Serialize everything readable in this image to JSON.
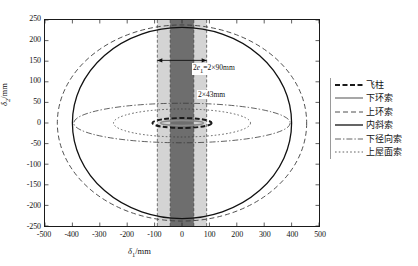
{
  "chart_data": {
    "type": "line",
    "title": "",
    "xlabel": "δ1/mm",
    "ylabel": "δ2/mm",
    "xlim": [
      -500,
      500
    ],
    "ylim": [
      -250,
      250
    ],
    "grid": false,
    "legend_position": "right",
    "xticks": [
      -500,
      -400,
      -300,
      -200,
      -100,
      0,
      100,
      200,
      300,
      400,
      500
    ],
    "yticks": [
      250,
      200,
      150,
      100,
      50,
      0,
      -50,
      -100,
      -150,
      -200,
      -250
    ],
    "series": [
      {
        "name": "飞柱",
        "style": "dashed-thick",
        "color": "#1a1a1a",
        "shape": "ellipse",
        "center": [
          0,
          0
        ],
        "semi_x": 108,
        "semi_y": 12
      },
      {
        "name": "下环索",
        "style": "solid-gray",
        "color": "#8a8a8a",
        "shape": "ellipse",
        "center": [
          0,
          0
        ],
        "semi_x": 78,
        "semi_y": 6
      },
      {
        "name": "上环索",
        "style": "dashed",
        "color": "#3a3a3a",
        "shape": "ellipse",
        "center": [
          0,
          0
        ],
        "semi_x": 455,
        "semi_y": 238
      },
      {
        "name": "内斜索",
        "style": "solid-thick",
        "color": "#111111",
        "shape": "ellipse",
        "center": [
          0,
          0
        ],
        "semi_x": 400,
        "semi_y": 232
      },
      {
        "name": "下径向索",
        "style": "dash-dot",
        "color": "#3a3a3a",
        "shape": "ellipse",
        "center": [
          0,
          0
        ],
        "semi_x": 395,
        "semi_y": 48
      },
      {
        "name": "上屋面索",
        "style": "dotted",
        "color": "#3a3a3a",
        "shape": "ellipse",
        "center": [
          0,
          0
        ],
        "semi_x": 250,
        "semi_y": 34
      }
    ],
    "bands": [
      {
        "name": "outer-tolerance-band",
        "label": "2e₁=2×90mm",
        "x_from": -90,
        "x_to": 90,
        "color": "#d4d4d4"
      },
      {
        "name": "inner-tolerance-band",
        "label": "2×43mm",
        "x_from": -43,
        "x_to": 43,
        "color": "#6e6e6e"
      }
    ],
    "annotations": [
      {
        "name": "outer-band-label",
        "text": "2e1=2×90mm",
        "x": 0,
        "y": 172
      },
      {
        "name": "inner-band-label",
        "text": "2×43mm",
        "x": 0,
        "y": 112
      }
    ]
  },
  "axes": {
    "x_title_main": "δ",
    "x_title_sub": "1",
    "x_title_unit": "/mm",
    "y_title_main": "δ",
    "y_title_sub": "2",
    "y_title_unit": "/mm",
    "xtick_labels": [
      "-500",
      "-400",
      "-300",
      "-200",
      "-100",
      "0",
      "100",
      "200",
      "300",
      "400",
      "500"
    ],
    "ytick_labels": [
      "250",
      "200",
      "150",
      "100",
      "50",
      "0",
      "-50",
      "-100",
      "-150",
      "-200",
      "-250"
    ]
  },
  "annotations": {
    "outer_prefix": "2",
    "outer_italic": "e",
    "outer_sub": "1",
    "outer_rest": "=2×90mm",
    "inner_text": "2×43mm"
  },
  "legend": {
    "items": [
      {
        "label": "飞柱",
        "style": "dashed-thick",
        "color": "#1a1a1a"
      },
      {
        "label": "下环索",
        "style": "solid-gray",
        "color": "#8a8a8a"
      },
      {
        "label": "上环索",
        "style": "dashed",
        "color": "#3a3a3a"
      },
      {
        "label": "内斜索",
        "style": "solid-thick",
        "color": "#111111"
      },
      {
        "label": "下径向索",
        "style": "dash-dot",
        "color": "#3a3a3a"
      },
      {
        "label": "上屋面索",
        "style": "dotted",
        "color": "#3a3a3a"
      }
    ]
  },
  "colors": {
    "frame": "#1a1a1a",
    "band_outer": "#d4d4d4",
    "band_inner": "#6e6e6e",
    "text": "#111111"
  }
}
